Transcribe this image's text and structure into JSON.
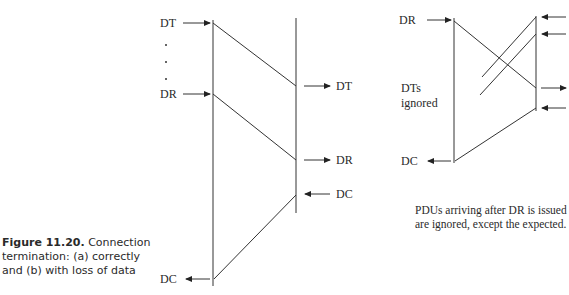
{
  "figure": {
    "caption_label": "Figure 11.20.",
    "caption_text": " Connection termination: (a) correctly and (b) with loss of data"
  },
  "diagram_a": {
    "left_labels": {
      "dt": "DT",
      "dr": "DR",
      "dc": "DC"
    },
    "right_labels": {
      "dt": "DT",
      "dr": "DR",
      "dc": "DC"
    }
  },
  "diagram_b": {
    "left_labels": {
      "dr": "DR",
      "dts_ignored_line1": "DTs",
      "dts_ignored_line2": "ignored",
      "dc": "DC"
    },
    "note_line1": "PDUs arriving after DR is issued",
    "note_line2": "are ignored, except the expected."
  }
}
